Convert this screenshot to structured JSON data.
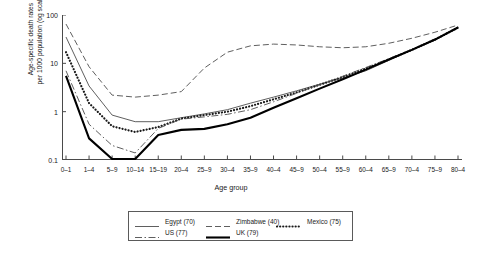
{
  "chart_data": {
    "type": "line",
    "title": "",
    "xlabel": "Age group",
    "ylabel_line1": "Age-specific death rates",
    "ylabel_line2": "per 1000 population (og scale)",
    "log_y": true,
    "ylim": [
      0.1,
      100
    ],
    "ytick_labels": [
      "100",
      "10",
      "1",
      "0.1"
    ],
    "ytick_values": [
      100,
      10,
      1,
      0.1
    ],
    "grid": false,
    "legend_position": "below-center",
    "categories": [
      "0–1",
      "1–4",
      "5–9",
      "10–14",
      "15–19",
      "20–4",
      "25–9",
      "30–4",
      "35–9",
      "40–4",
      "45–9",
      "50–4",
      "55–9",
      "60–4",
      "65–9",
      "70–4",
      "75–9",
      "80–4"
    ],
    "series": [
      {
        "name": "Egypt (70)",
        "label": "Egypt (70)",
        "style": "solid-thin",
        "values": [
          35,
          3.4,
          0.85,
          0.62,
          0.62,
          0.75,
          0.9,
          1.1,
          1.5,
          2.0,
          2.7,
          3.7,
          5.0,
          7.0,
          11.5,
          19,
          30,
          56
        ]
      },
      {
        "name": "Zimbabwe (40)",
        "label": "Zimbabwe (40)",
        "style": "dashed",
        "values": [
          65,
          8.5,
          2.2,
          2.0,
          2.2,
          2.6,
          8.0,
          17,
          23,
          25,
          24,
          22,
          21,
          22,
          26,
          33,
          44,
          62
        ]
      },
      {
        "name": "Mexico (75)",
        "label": "Mexico (75)",
        "style": "dotted",
        "values": [
          17,
          1.5,
          0.5,
          0.38,
          0.48,
          0.72,
          0.85,
          1.0,
          1.3,
          1.8,
          2.5,
          3.6,
          5.2,
          7.8,
          12,
          19,
          31,
          55
        ]
      },
      {
        "name": "US (77)",
        "label": "US (77)",
        "style": "dash-dot",
        "values": [
          7.0,
          0.55,
          0.2,
          0.14,
          0.45,
          0.7,
          0.78,
          0.88,
          1.1,
          1.6,
          2.4,
          3.6,
          5.4,
          8.2,
          12.5,
          19.5,
          31,
          55
        ]
      },
      {
        "name": "UK (79)",
        "label": "UK (79)",
        "style": "solid-thick",
        "values": [
          5.5,
          0.28,
          0.105,
          0.105,
          0.33,
          0.42,
          0.44,
          0.55,
          0.75,
          1.2,
          1.9,
          3.0,
          4.7,
          7.4,
          12,
          19,
          31,
          55
        ]
      }
    ]
  },
  "legend": {
    "row1": [
      "Egypt (70)",
      "Zimbabwe (40)",
      "Mexico (75)"
    ],
    "row2": [
      "US (77)",
      "UK (79)"
    ]
  },
  "colors": {
    "ink": "#1a1a1a",
    "axis": "#4a4a4a",
    "thin_line": "#4d4d4d",
    "thick_line": "#000000"
  }
}
